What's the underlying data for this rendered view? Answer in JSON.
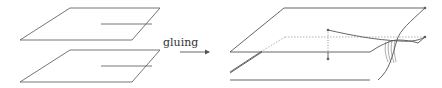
{
  "figure": {
    "arrow_label": "gluing",
    "left": {
      "description": "two separate planar sheets, each with a slit",
      "sheets": [
        "upper-sheet",
        "lower-sheet"
      ]
    },
    "right": {
      "description": "two sheets glued along the slits forming a connected surface"
    }
  },
  "colors": {
    "stroke": "#555555",
    "dashed": "#999999",
    "background": "#ffffff"
  }
}
